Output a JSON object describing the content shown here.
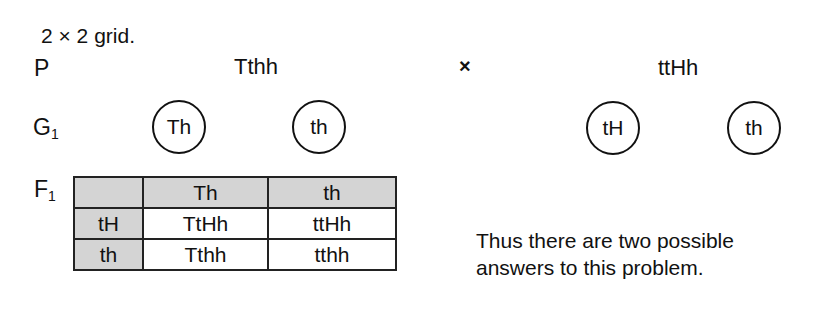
{
  "caption": "2 × 2 grid.",
  "generations": {
    "parent_label": "P",
    "gamete_label": "G",
    "gamete_sub": "1",
    "f1_label": "F",
    "f1_sub": "1"
  },
  "parents": {
    "left": "Tthh",
    "cross_symbol": "×",
    "right": "ttHh"
  },
  "gametes": {
    "left": [
      "Th",
      "th"
    ],
    "right": [
      "tH",
      "th"
    ]
  },
  "punnett": {
    "corner": "",
    "col_headers": [
      "Th",
      "th"
    ],
    "rows": [
      {
        "header": "tH",
        "cells": [
          "TtHh",
          "ttHh"
        ]
      },
      {
        "header": "th",
        "cells": [
          "Tthh",
          "tthh"
        ]
      }
    ],
    "header_shade": "#d4d4d4"
  },
  "conclusion": "Thus there are two possible answers to this problem."
}
